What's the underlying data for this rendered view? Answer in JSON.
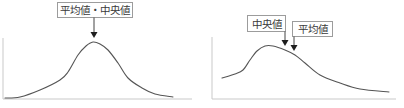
{
  "chart_data": [
    {
      "type": "line",
      "title": "",
      "xlabel": "",
      "ylabel": "",
      "grid": false,
      "legend": null,
      "coordinate_units": "px (panel-local)",
      "axes": {
        "origin": [
          3,
          99
        ],
        "x_end": 192,
        "y_top": 38
      },
      "series": [
        {
          "name": "symmetric-distribution",
          "points": [
            [
              5,
              98
            ],
            [
              20,
              97
            ],
            [
              40,
              90
            ],
            [
              60,
              80
            ],
            [
              68,
              72
            ],
            [
              78,
              55
            ],
            [
              86,
              46
            ],
            [
              93,
              42
            ],
            [
              100,
              44
            ],
            [
              108,
              50
            ],
            [
              118,
              63
            ],
            [
              128,
              78
            ],
            [
              142,
              88
            ],
            [
              155,
              94
            ],
            [
              173,
              97
            ]
          ]
        }
      ],
      "annotations": [
        {
          "text": "平均値・中央値",
          "points_to": [
            94,
            38
          ]
        }
      ]
    },
    {
      "type": "line",
      "title": "",
      "xlabel": "",
      "ylabel": "",
      "grid": false,
      "legend": null,
      "coordinate_units": "px (panel-local)",
      "axes": {
        "origin": [
          10,
          99
        ],
        "x_end": 194,
        "y_top": 37
      },
      "series": [
        {
          "name": "skewed-distribution",
          "points": [
            [
              20,
              78
            ],
            [
              33,
              74
            ],
            [
              41,
              70
            ],
            [
              48,
              60
            ],
            [
              55,
              51
            ],
            [
              63,
              46
            ],
            [
              71,
              46
            ],
            [
              83,
              50
            ],
            [
              93,
              55
            ],
            [
              103,
              63
            ],
            [
              118,
              75
            ],
            [
              138,
              83
            ],
            [
              158,
              89
            ],
            [
              187,
              92
            ]
          ]
        }
      ],
      "annotations": [
        {
          "text": "中央値",
          "points_to": [
            83,
            46
          ]
        },
        {
          "text": "平均値",
          "points_to": [
            92,
            51
          ]
        }
      ]
    }
  ]
}
